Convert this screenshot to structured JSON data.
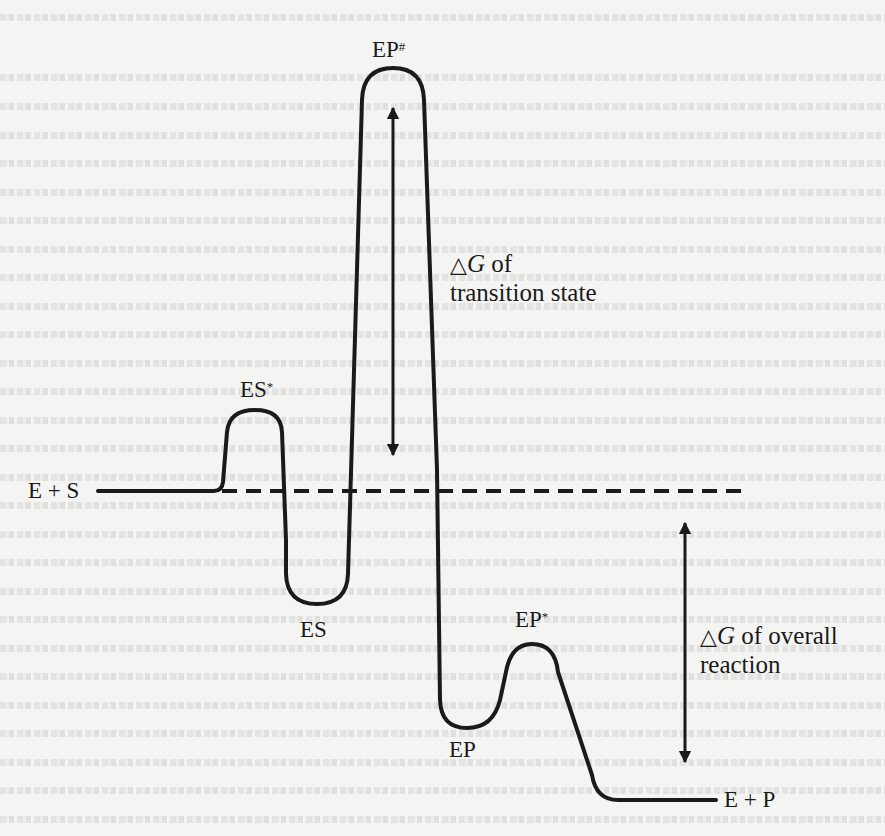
{
  "figure": {
    "type": "free-energy reaction coordinate diagram",
    "background": "#f4f4f2",
    "stroke_color": "#1a1a1a"
  },
  "states": {
    "reactants": {
      "label": "E + S"
    },
    "es_transition": {
      "base": "ES",
      "sup": "*"
    },
    "es_complex": {
      "label": "ES"
    },
    "main_transition": {
      "base": "EP",
      "sup": "#"
    },
    "ep_complex": {
      "label": "EP"
    },
    "ep_transition": {
      "base": "EP",
      "sup": "*"
    },
    "products": {
      "label": "E + P"
    }
  },
  "annotations": {
    "transition_state": {
      "symbol": "△",
      "var": "G",
      "line1_rest": " of",
      "line2": "transition state"
    },
    "overall_reaction": {
      "symbol": "△",
      "var": "G",
      "line1_rest": " of overall",
      "line2": "reaction"
    }
  },
  "reference_line": {
    "style": "dashed",
    "level_of": "E + S"
  }
}
